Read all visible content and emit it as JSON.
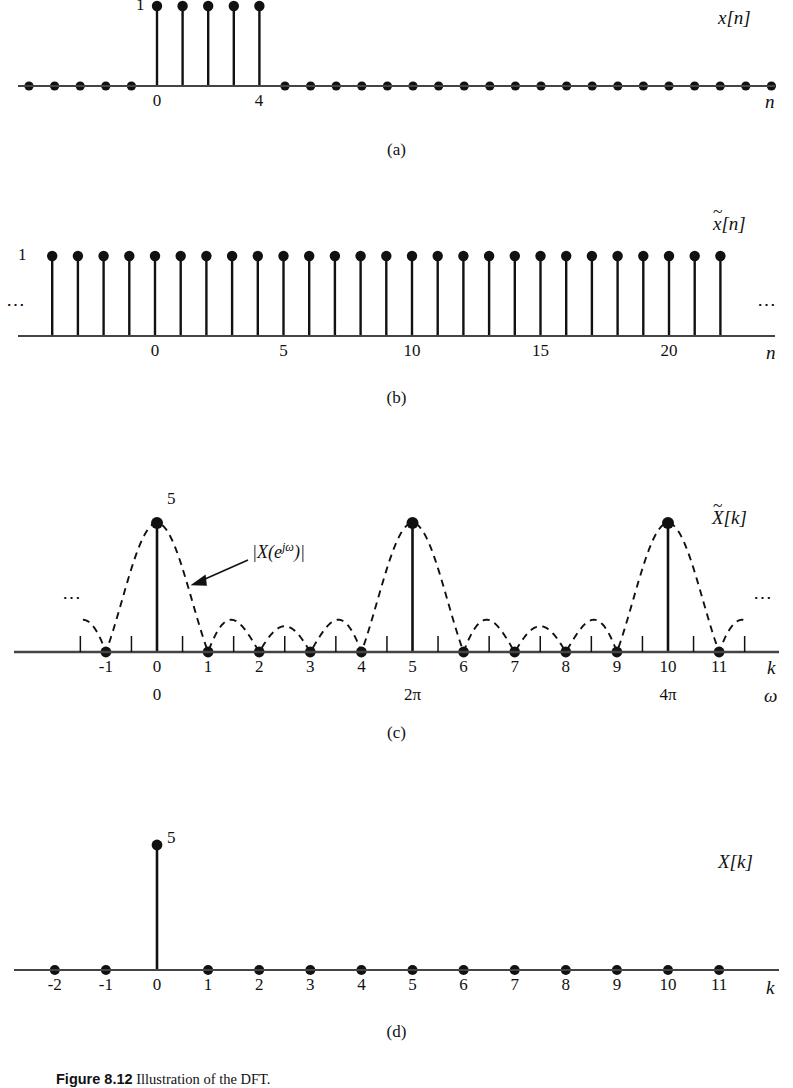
{
  "figure": {
    "caption_label": "Figure 8.12",
    "caption_text": "Illustration of the DFT.",
    "subcaptions": [
      "(a)",
      "(b)",
      "(c)",
      "(d)"
    ]
  },
  "panel_a": {
    "signal_label": "x[n]",
    "axis_label": "n",
    "amplitude_label": "1",
    "tick_labels": [
      "0",
      "4"
    ],
    "x_min": -5,
    "x_max": 26
  },
  "panel_b": {
    "signal_label": "x̃[n]",
    "signal_base": "x",
    "axis_label": "n",
    "amplitude_label": "1",
    "tick_labels": [
      "0",
      "5",
      "10",
      "15",
      "20"
    ],
    "left_ellipsis": "⋯",
    "right_ellipsis": "⋯",
    "x_min": -4,
    "x_max": 22
  },
  "panel_c": {
    "signal_label": "X̃[k]",
    "signal_base": "X",
    "axis_label_k": "k",
    "axis_label_omega": "ω",
    "amplitude_label": "5",
    "envelope_label": "|X(e^{jω})|",
    "envelope_label_parts": {
      "pre": "|X(e",
      "sup": "jω",
      "post": ")|"
    },
    "k_tick_labels": [
      "-1",
      "0",
      "1",
      "2",
      "3",
      "4",
      "5",
      "6",
      "7",
      "8",
      "9",
      "10",
      "11"
    ],
    "omega_tick_labels": [
      {
        "k": 0,
        "text": "0"
      },
      {
        "k": 5,
        "text": "2π"
      },
      {
        "k": 10,
        "text": "4π"
      }
    ],
    "left_ellipsis": "⋯",
    "right_ellipsis": "⋯"
  },
  "panel_d": {
    "signal_label": "X[k]",
    "axis_label": "k",
    "amplitude_label": "5",
    "k_tick_labels": [
      "-2",
      "-1",
      "0",
      "1",
      "2",
      "3",
      "4",
      "5",
      "6",
      "7",
      "8",
      "9",
      "10",
      "11"
    ]
  },
  "chart_data": [
    {
      "id": "a",
      "type": "stem",
      "title": "x[n]",
      "xlabel": "n",
      "ylabel": "",
      "x": [
        -5,
        -4,
        -3,
        -2,
        -1,
        0,
        1,
        2,
        3,
        4,
        5,
        6,
        7,
        8,
        9,
        10,
        11,
        12,
        13,
        14,
        15,
        16,
        17,
        18,
        19,
        20,
        21,
        22,
        23,
        24,
        25,
        26
      ],
      "values": [
        0,
        0,
        0,
        0,
        0,
        1,
        1,
        1,
        1,
        1,
        0,
        0,
        0,
        0,
        0,
        0,
        0,
        0,
        0,
        0,
        0,
        0,
        0,
        0,
        0,
        0,
        0,
        0,
        0,
        0,
        0,
        0
      ],
      "ylim": [
        0,
        1.1
      ],
      "xlim": [
        -5,
        26
      ],
      "labeled_ticks": [
        0,
        4
      ],
      "annotations": [
        "1"
      ],
      "grid": false,
      "legend": "none"
    },
    {
      "id": "b",
      "type": "stem",
      "title": "x̃[n]",
      "xlabel": "n",
      "ylabel": "",
      "x": [
        -4,
        -3,
        -2,
        -1,
        0,
        1,
        2,
        3,
        4,
        5,
        6,
        7,
        8,
        9,
        10,
        11,
        12,
        13,
        14,
        15,
        16,
        17,
        18,
        19,
        20,
        21,
        22
      ],
      "values": [
        1,
        1,
        1,
        1,
        1,
        1,
        1,
        1,
        1,
        1,
        1,
        1,
        1,
        1,
        1,
        1,
        1,
        1,
        1,
        1,
        1,
        1,
        1,
        1,
        1,
        1,
        1
      ],
      "ylim": [
        0,
        1.1
      ],
      "xlim": [
        -4.8,
        22.8
      ],
      "labeled_ticks": [
        0,
        5,
        10,
        15,
        20
      ],
      "annotations": [
        "1",
        "⋯",
        "⋯"
      ],
      "note": "periodic extension of x[n] with period N=5, all values equal 1",
      "grid": false,
      "legend": "none"
    },
    {
      "id": "c",
      "type": "stem",
      "title": "X̃[k]",
      "xlabel": "k",
      "xlabel2": "ω",
      "ylabel": "",
      "x": [
        -1,
        0,
        1,
        2,
        3,
        4,
        5,
        6,
        7,
        8,
        9,
        10,
        11
      ],
      "values": [
        0,
        5,
        0,
        0,
        0,
        0,
        5,
        0,
        0,
        0,
        0,
        5,
        0
      ],
      "ylim": [
        0,
        5.6
      ],
      "xlim": [
        -1.6,
        11.8
      ],
      "labeled_ticks": [
        -1,
        0,
        1,
        2,
        3,
        4,
        5,
        6,
        7,
        8,
        9,
        10,
        11
      ],
      "minor_ticks_at_half_integers": true,
      "omega_mapping": [
        {
          "k": 0,
          "omega": "0"
        },
        {
          "k": 5,
          "omega": "2π"
        },
        {
          "k": 10,
          "omega": "4π"
        }
      ],
      "overlay": {
        "name": "|X(e^{jω})|",
        "style": "dashed",
        "description": "Dirichlet kernel magnitude |sin(5ω/2)/sin(ω/2)|, period 5 in k, main lobe peak 5 at k=0,5,10, zeros at non-multiple integers",
        "peak_value": 5,
        "zeros_at_k": [
          -1,
          1,
          2,
          3,
          4,
          6,
          7,
          8,
          9,
          11
        ],
        "sidelobe_peaks_approx": [
          1.4,
          1.0,
          1.0,
          1.4
        ]
      },
      "annotations": [
        "5",
        "|X(e^{jω})|",
        "⋯",
        "⋯"
      ],
      "grid": false,
      "legend": "none"
    },
    {
      "id": "d",
      "type": "stem",
      "title": "X[k]",
      "xlabel": "k",
      "ylabel": "",
      "x": [
        -2,
        -1,
        0,
        1,
        2,
        3,
        4,
        5,
        6,
        7,
        8,
        9,
        10,
        11
      ],
      "values": [
        0,
        0,
        5,
        0,
        0,
        0,
        0,
        0,
        0,
        0,
        0,
        0,
        0,
        0
      ],
      "ylim": [
        0,
        5.6
      ],
      "xlim": [
        -2.7,
        11.9
      ],
      "labeled_ticks": [
        -2,
        -1,
        0,
        1,
        2,
        3,
        4,
        5,
        6,
        7,
        8,
        9,
        10,
        11
      ],
      "annotations": [
        "5"
      ],
      "grid": false,
      "legend": "none"
    }
  ]
}
